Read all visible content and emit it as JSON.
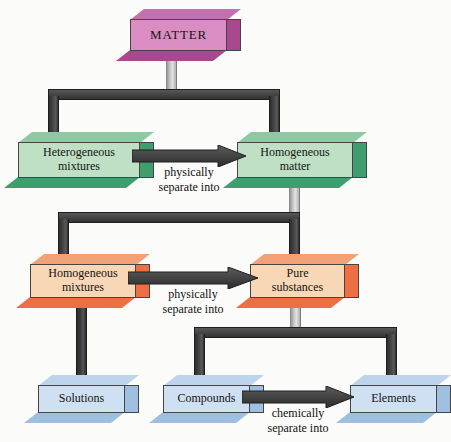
{
  "diagram": {
    "background_color": "#fbfbf9",
    "nodes": {
      "matter": {
        "label": "MATTER",
        "color": "#d98dc2",
        "category": "pink"
      },
      "heterogeneous": {
        "line1": "Heterogeneous",
        "line2": "mixtures",
        "color": "#bfe0c4",
        "category": "green"
      },
      "homog_matter": {
        "line1": "Homogeneous",
        "line2": "matter",
        "color": "#bfe0c4",
        "category": "green"
      },
      "homog_mixtures": {
        "line1": "Homogeneous",
        "line2": "mixtures",
        "color": "#f7d7b6",
        "category": "orange"
      },
      "pure": {
        "line1": "Pure",
        "line2": "substances",
        "color": "#f7d7b6",
        "category": "orange"
      },
      "solutions": {
        "label": "Solutions",
        "color": "#cfe0f2",
        "category": "blue"
      },
      "compounds": {
        "label": "Compounds",
        "color": "#cfe0f2",
        "category": "blue"
      },
      "elements": {
        "label": "Elements",
        "color": "#cfe0f2",
        "category": "blue"
      }
    },
    "arrows": [
      {
        "id": "hetero-to-homog",
        "from": "heterogeneous",
        "to": "homog_matter",
        "line1": "physically",
        "line2": "separate into"
      },
      {
        "id": "homogmix-to-pure",
        "from": "homog_mixtures",
        "to": "pure",
        "line1": "physically",
        "line2": "separate into"
      },
      {
        "id": "compounds-to-elem",
        "from": "compounds",
        "to": "elements",
        "line1": "chemically",
        "line2": "separate into"
      }
    ],
    "connector_color": "#3a3a3a",
    "stem_color": "#c9c9c9"
  }
}
